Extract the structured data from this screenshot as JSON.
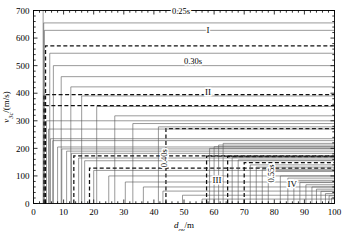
{
  "chart_data": {
    "type": "line",
    "title": "",
    "xlabel": "d_ov/m",
    "ylabel": "v_3c/(m/s)",
    "xlim": [
      0,
      100
    ],
    "ylim": [
      0,
      700
    ],
    "xticks": [
      0,
      10,
      20,
      30,
      40,
      50,
      60,
      70,
      80,
      90,
      100
    ],
    "xticklabels": [
      "0",
      "10",
      "20",
      "30",
      "40",
      "50",
      "60",
      "70",
      "80",
      "90",
      "100"
    ],
    "yticks": [
      0,
      100,
      200,
      300,
      400,
      500,
      600,
      700
    ],
    "yticklabels": [
      "0",
      "100",
      "200",
      "300",
      "400",
      "500",
      "600",
      "700"
    ],
    "grid": false,
    "legend": "none",
    "minor_ticks": true,
    "annotations": [
      {
        "text": "0.25s",
        "x": 49,
        "y": 700,
        "rotation": 0,
        "name": "label-0-25s"
      },
      {
        "text": "0.30s",
        "x": 53,
        "y": 518,
        "rotation": 0,
        "name": "label-0-30s"
      },
      {
        "text": "0.40s",
        "x": 44.5,
        "y": 175,
        "rotation": -90,
        "name": "label-0-40s"
      },
      {
        "text": "0.55s",
        "x": 80,
        "y": 120,
        "rotation": -90,
        "name": "label-0-55s"
      },
      {
        "text": "I",
        "x": 58,
        "y": 628,
        "rotation": 0,
        "name": "region-label-I"
      },
      {
        "text": "II",
        "x": 58,
        "y": 406,
        "rotation": 0,
        "name": "region-label-II"
      },
      {
        "text": "III",
        "x": 61,
        "y": 85,
        "rotation": 0,
        "name": "region-label-III"
      },
      {
        "text": "IV",
        "x": 86,
        "y": 72,
        "rotation": 0,
        "name": "region-label-IV"
      }
    ],
    "curve_style": "step-up-then-plateau",
    "series": [
      {
        "name": "c01",
        "x_break": 3.2,
        "plateau": 700,
        "dashed": false
      },
      {
        "name": "c02",
        "x_break": 3.4,
        "plateau": 655,
        "dashed": false
      },
      {
        "name": "c03",
        "x_break": 3.6,
        "plateau": 628,
        "dashed": false
      },
      {
        "name": "c04",
        "x_break": 4.0,
        "plateau": 572,
        "dashed": true
      },
      {
        "name": "c05",
        "x_break": 5.4,
        "plateau": 545,
        "dashed": false
      },
      {
        "name": "c06",
        "x_break": 6.6,
        "plateau": 500,
        "dashed": false
      },
      {
        "name": "c07",
        "x_break": 9.2,
        "plateau": 460,
        "dashed": false
      },
      {
        "name": "c08",
        "x_break": 12.4,
        "plateau": 423,
        "dashed": false
      },
      {
        "name": "c09",
        "x_break": 16.0,
        "plateau": 390,
        "dashed": false
      },
      {
        "name": "c10",
        "x_break": 21.0,
        "plateau": 352,
        "dashed": false
      },
      {
        "name": "c11",
        "x_break": 27.0,
        "plateau": 318,
        "dashed": false
      },
      {
        "name": "c12",
        "x_break": 33.0,
        "plateau": 290,
        "dashed": false
      },
      {
        "name": "c13",
        "x_break": 41.5,
        "plateau": 278,
        "dashed": false
      },
      {
        "name": "c14",
        "x_break": 44.0,
        "plateau": 272,
        "dashed": true
      },
      {
        "name": "c15",
        "x_break": 3.5,
        "plateau": 395,
        "dashed": true
      },
      {
        "name": "c16",
        "x_break": 3.9,
        "plateau": 355,
        "dashed": true
      },
      {
        "name": "c17",
        "x_break": 4.3,
        "plateau": 300,
        "dashed": false
      },
      {
        "name": "c18",
        "x_break": 5.0,
        "plateau": 270,
        "dashed": false
      },
      {
        "name": "c19",
        "x_break": 5.6,
        "plateau": 235,
        "dashed": false
      },
      {
        "name": "c20",
        "x_break": 6.4,
        "plateau": 228,
        "dashed": false
      },
      {
        "name": "c21",
        "x_break": 8.0,
        "plateau": 205,
        "dashed": false
      },
      {
        "name": "c22",
        "x_break": 9.4,
        "plateau": 198,
        "dashed": false
      },
      {
        "name": "c23",
        "x_break": 11.0,
        "plateau": 190,
        "dashed": false
      },
      {
        "name": "c24",
        "x_break": 12.6,
        "plateau": 182,
        "dashed": false
      },
      {
        "name": "c25",
        "x_break": 13.4,
        "plateau": 173,
        "dashed": true
      },
      {
        "name": "c26",
        "x_break": 15.0,
        "plateau": 165,
        "dashed": false
      },
      {
        "name": "c27",
        "x_break": 17.0,
        "plateau": 155,
        "dashed": false
      },
      {
        "name": "c28",
        "x_break": 18.6,
        "plateau": 128,
        "dashed": true
      },
      {
        "name": "c29",
        "x_break": 20.0,
        "plateau": 120,
        "dashed": false
      },
      {
        "name": "c30",
        "x_break": 25.0,
        "plateau": 100,
        "dashed": false
      },
      {
        "name": "c31",
        "x_break": 30.5,
        "plateau": 78,
        "dashed": false
      },
      {
        "name": "c32",
        "x_break": 36.5,
        "plateau": 60,
        "dashed": false
      },
      {
        "name": "c33",
        "x_break": 43.0,
        "plateau": 45,
        "dashed": false
      },
      {
        "name": "c34",
        "x_break": 49.5,
        "plateau": 30,
        "dashed": false
      },
      {
        "name": "c35",
        "x_break": 56.0,
        "plateau": 16,
        "dashed": false
      },
      {
        "name": "c36",
        "x_break": 57.5,
        "plateau": 172,
        "dashed": true
      },
      {
        "name": "c37",
        "x_break": 58.5,
        "plateau": 200,
        "dashed": false
      },
      {
        "name": "c38",
        "x_break": 60.0,
        "plateau": 206,
        "dashed": false
      },
      {
        "name": "c39",
        "x_break": 61.5,
        "plateau": 212,
        "dashed": false
      },
      {
        "name": "c40",
        "x_break": 63.0,
        "plateau": 218,
        "dashed": false
      },
      {
        "name": "c41",
        "x_break": 64.5,
        "plateau": 170,
        "dashed": true
      },
      {
        "name": "c42",
        "x_break": 66.0,
        "plateau": 168,
        "dashed": false
      },
      {
        "name": "c43",
        "x_break": 68.0,
        "plateau": 158,
        "dashed": false
      },
      {
        "name": "c44",
        "x_break": 70.0,
        "plateau": 148,
        "dashed": true
      },
      {
        "name": "c45",
        "x_break": 72.0,
        "plateau": 140,
        "dashed": false
      },
      {
        "name": "c46",
        "x_break": 74.0,
        "plateau": 132,
        "dashed": false
      },
      {
        "name": "c47",
        "x_break": 76.0,
        "plateau": 124,
        "dashed": false
      },
      {
        "name": "c48",
        "x_break": 78.0,
        "plateau": 116,
        "dashed": false
      },
      {
        "name": "c49",
        "x_break": 82.0,
        "plateau": 100,
        "dashed": false
      },
      {
        "name": "c50",
        "x_break": 84.5,
        "plateau": 92,
        "dashed": false
      },
      {
        "name": "c51",
        "x_break": 86.5,
        "plateau": 84,
        "dashed": false
      },
      {
        "name": "c52",
        "x_break": 88.5,
        "plateau": 76,
        "dashed": false
      },
      {
        "name": "c53",
        "x_break": 90.5,
        "plateau": 68,
        "dashed": false
      },
      {
        "name": "c54",
        "x_break": 92.5,
        "plateau": 60,
        "dashed": false
      },
      {
        "name": "c55",
        "x_break": 94.0,
        "plateau": 52,
        "dashed": false
      },
      {
        "name": "c56",
        "x_break": 95.5,
        "plateau": 44,
        "dashed": false
      },
      {
        "name": "c57",
        "x_break": 97.0,
        "plateau": 36,
        "dashed": false
      },
      {
        "name": "c58",
        "x_break": 98.2,
        "plateau": 28,
        "dashed": false
      },
      {
        "name": "c59",
        "x_break": 99.0,
        "plateau": 20,
        "dashed": false
      }
    ]
  },
  "colors": {
    "axis": "#000000",
    "curve": "#555555",
    "curve_dark": "#111111",
    "background": "#ffffff"
  }
}
